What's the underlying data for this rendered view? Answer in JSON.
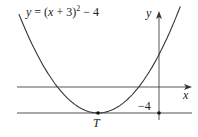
{
  "diagram": {
    "equation_label": {
      "lhs": "y",
      "eq": " = (",
      "x": "x",
      "rest": " + 3)",
      "exp": "2",
      "tail": " − 4"
    },
    "axis_labels": {
      "x": "x",
      "y": "y"
    },
    "point_label": "T",
    "line_value_label": "−4",
    "curve": {
      "a": 1,
      "h": -3,
      "k": -4,
      "x_range": [
        -6.9,
        1.05
      ]
    },
    "horizontal_line_y": -4,
    "vertex": {
      "name": "T",
      "x": -3,
      "y": -4
    },
    "colors": {
      "stroke": "#333333",
      "text": "#222222"
    }
  }
}
